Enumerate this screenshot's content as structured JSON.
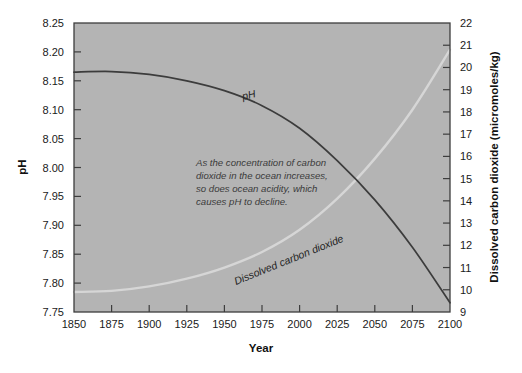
{
  "figure": {
    "background_color": "#ffffff",
    "plot_background_color": "#b4b4b4",
    "frame_color": "#3d3d3d"
  },
  "chart_data": {
    "type": "line",
    "title": "",
    "xlabel": "Year",
    "ylabel": "pH",
    "y2label": "Dissolved carbon dioxide (micromoles/kg)",
    "xlim": [
      1850,
      2100
    ],
    "ylim": [
      7.75,
      8.25
    ],
    "y2lim": [
      9,
      22
    ],
    "grid": false,
    "legend_position": "inline-curve-labels",
    "xticks": [
      1850,
      1875,
      1900,
      1925,
      1950,
      1975,
      2000,
      2025,
      2050,
      2075,
      2100
    ],
    "xtick_labels": [
      "1850",
      "1875",
      "1900",
      "1925",
      "1950",
      "1975",
      "2000",
      "2025",
      "2050",
      "2075",
      "2100"
    ],
    "yticks": [
      7.75,
      7.8,
      7.85,
      7.9,
      7.95,
      8.0,
      8.05,
      8.1,
      8.15,
      8.2,
      8.25
    ],
    "ytick_labels": [
      "7.75",
      "7.80",
      "7.85",
      "7.90",
      "7.95",
      "8.00",
      "8.05",
      "8.10",
      "8.15",
      "8.20",
      "8.25"
    ],
    "y2ticks": [
      9,
      10,
      11,
      12,
      13,
      14,
      15,
      16,
      17,
      18,
      19,
      20,
      21,
      22
    ],
    "y2tick_labels": [
      "9",
      "10",
      "11",
      "12",
      "13",
      "14",
      "15",
      "16",
      "17",
      "18",
      "19",
      "20",
      "21",
      "22"
    ],
    "x": [
      1850,
      1875,
      1900,
      1925,
      1950,
      1975,
      2000,
      2025,
      2050,
      2075,
      2100
    ],
    "series": [
      {
        "name": "pH",
        "axis": "left",
        "color": "#3c3c3c",
        "label_text": "pH",
        "values": [
          8.165,
          8.166,
          8.161,
          8.15,
          8.133,
          8.107,
          8.068,
          8.012,
          7.944,
          7.862,
          7.766
        ]
      },
      {
        "name": "Dissolved carbon dioxide",
        "axis": "right",
        "color": "#d6d6d6",
        "label_text": "Dissolved carbon dioxide",
        "values": [
          9.9,
          9.95,
          10.15,
          10.5,
          11.0,
          11.7,
          12.7,
          14.1,
          15.9,
          18.1,
          20.8
        ]
      }
    ],
    "annotation": {
      "lines": [
        "As the concentration of carbon",
        "dioxide in the ocean increases,",
        "so does ocean acidity, which",
        "causes pH to decline."
      ]
    }
  }
}
